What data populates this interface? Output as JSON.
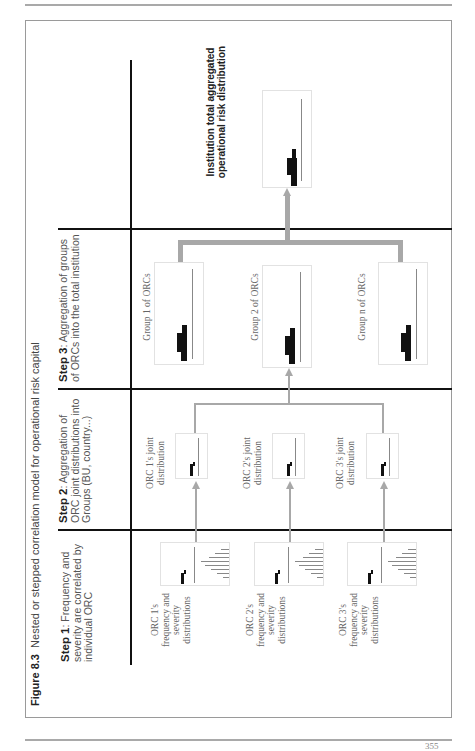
{
  "page": {
    "page_number": "355"
  },
  "caption": {
    "label": "Figure 8.3",
    "title": "Nested or stepped correlation model for operational risk capital"
  },
  "steps": [
    {
      "id": "step1",
      "bold": "Step 1",
      "text": ": Frequency and severity are correlated by individual ORC"
    },
    {
      "id": "step2",
      "bold": "Step 2",
      "text": ": Aggregation of ORC joint distributions into Groups (BU, country...)"
    },
    {
      "id": "step3",
      "bold": "Step 3",
      "text": ": Aggregation of groups of ORCs into the total institution"
    }
  ],
  "step1_items": [
    {
      "label": "ORC 1's frequency and severity distributions"
    },
    {
      "label": "ORC 2's frequency and severity distributions"
    },
    {
      "label": "ORC 3's frequency and severity distributions"
    }
  ],
  "step2_items": [
    {
      "label": "ORC 1's joint distribution"
    },
    {
      "label": "ORC 2's joint distribution"
    },
    {
      "label": "ORC 3's joint distribution"
    }
  ],
  "step3_items": [
    {
      "label": "Group 1 of ORCs"
    },
    {
      "label": "Group 2 of ORCs"
    },
    {
      "label": "Group n of ORCs"
    }
  ],
  "final": {
    "label": "Institution total aggregated operational risk distribution"
  },
  "colors": {
    "connector": "#a8a8a8",
    "divider": "#111111",
    "histogram": "#111111"
  }
}
